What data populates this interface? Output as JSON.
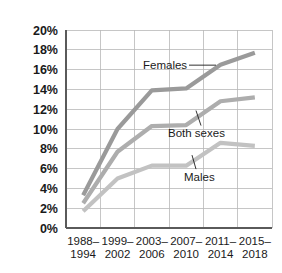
{
  "chart_data": {
    "type": "line",
    "title": "",
    "subtitle": "",
    "xlabel": "",
    "ylabel": "",
    "categories": [
      "1988–\n1994",
      "1999–\n2002",
      "2003–\n2006",
      "2007–\n2010",
      "2011–\n2014",
      "2015–\n2018"
    ],
    "category_lines": [
      [
        "1988–",
        "1994"
      ],
      [
        "1999–",
        "2002"
      ],
      [
        "2003–",
        "2006"
      ],
      [
        "2007–",
        "2010"
      ],
      [
        "2011–",
        "2014"
      ],
      [
        "2015–",
        "2018"
      ]
    ],
    "ylim": [
      0,
      20
    ],
    "yticks": [
      0,
      2,
      4,
      6,
      8,
      10,
      12,
      14,
      16,
      18,
      20
    ],
    "ytick_labels": [
      "0%",
      "2%",
      "4%",
      "6%",
      "8%",
      "10%",
      "12%",
      "14%",
      "16%",
      "18%",
      "20%"
    ],
    "grid": true,
    "grid_x": true,
    "grid_y": true,
    "legend_position": "inline-annotations",
    "series": [
      {
        "name": "Females",
        "color": "#9a9a9a",
        "values": [
          3.3,
          10.0,
          13.9,
          14.1,
          16.5,
          17.7
        ]
      },
      {
        "name": "Both sexes",
        "color": "#adadad",
        "values": [
          2.5,
          7.7,
          10.3,
          10.4,
          12.8,
          13.2
        ]
      },
      {
        "name": "Males",
        "color": "#c2c2c2",
        "values": [
          1.7,
          5.0,
          6.3,
          6.3,
          8.6,
          8.3
        ]
      }
    ],
    "annotations": [
      {
        "text": "Females",
        "x": 3.1,
        "y": 16.45
      },
      {
        "text": "Both sexes",
        "x": 3.55,
        "y": 10.55
      },
      {
        "text": "Males",
        "x": 3.85,
        "y": 6.15
      }
    ]
  },
  "axis": {
    "y_axis_name": "percent-axis",
    "x_axis_name": "period-axis"
  }
}
